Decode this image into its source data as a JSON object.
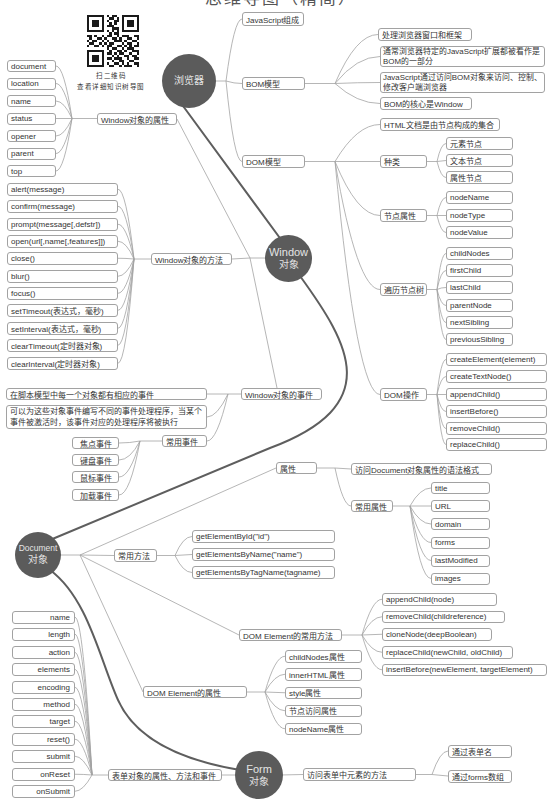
{
  "title": "思维导图（精简）",
  "qr_code": {
    "icon": "qr-code-icon",
    "caption_line1": "扫二维码",
    "caption_line2": "查看详细知识树导图"
  },
  "window_object": {
    "label_line1": "Window",
    "label_line2": "对象"
  },
  "browser": {
    "label": "浏览器",
    "js_composition": "JavaScript组成",
    "bom": {
      "label": "BOM模型",
      "items": [
        "处理浏览器窗口和框架",
        "通常浏览器特定的JavaScript扩展都被看作是BOM的一部分",
        "JavaScript通过访问BOM对象来访问、控制、修改客户端浏览器",
        "BOM的核心是Window"
      ]
    },
    "dom": {
      "label": "DOM模型",
      "intro": "HTML文档是由节点构成的集合",
      "kinds": {
        "label": "种类",
        "items": [
          "元素节点",
          "文本节点",
          "属性节点"
        ]
      },
      "node_props": {
        "label": "节点属性",
        "items": [
          "nodeName",
          "nodeType",
          "nodeValue"
        ]
      },
      "traverse": {
        "label": "遍历节点树",
        "items": [
          "childNodes",
          "firstChild",
          "lastChild",
          "parentNode",
          "nextSibling",
          "previousSibling"
        ]
      },
      "ops": {
        "label": "DOM操作",
        "items": [
          "createElement(element)",
          "createTextNode()",
          "appendChild()",
          "insertBefore()",
          "removeChild()",
          "replaceChild()"
        ]
      }
    }
  },
  "window_props": {
    "label": "Window对象的属性",
    "items": [
      "document",
      "location",
      "name",
      "status",
      "opener",
      "parent",
      "top"
    ]
  },
  "window_methods": {
    "label": "Window对象的方法",
    "items": [
      "alert(message)",
      "confirm(message)",
      "prompt(message[,defstr])",
      "open(url[,name[,features]])",
      "close()",
      "blur()",
      "focus()",
      "setTimeout(表达式，毫秒)",
      "setInterval(表达式，毫秒)",
      "clearTimeout(定时器对象)",
      "clearInterval(定时器对象)"
    ]
  },
  "window_events": {
    "label": "Window对象的事件",
    "items": [
      "在脚本模型中每一个对象都有相应的事件",
      "可以为这些对象事件编写不同的事件处理程序，当某个事件被激活时，该事件对应的处理程序将被执行"
    ],
    "common": {
      "label": "常用事件",
      "items": [
        "焦点事件",
        "键盘事件",
        "鼠标事件",
        "加载事件"
      ]
    }
  },
  "document": {
    "label_line1": "Document",
    "label_line2": "对象",
    "props": {
      "label": "属性",
      "syntax": "访问Document对象属性的语法格式",
      "common": {
        "label": "常用属性",
        "items": [
          "title",
          "URL",
          "domain",
          "forms",
          "lastModified",
          "images"
        ]
      }
    },
    "methods": {
      "label": "常用方法",
      "items": [
        "getElementById(\"id\")",
        "getElementsByName(\"name\")",
        "getElementsByTagName(tagname)"
      ]
    },
    "element_methods": {
      "label": "DOM Element的常用方法",
      "items": [
        "appendChild(node)",
        "removeChild(childreference)",
        "cloneNode(deepBoolean)",
        "replaceChild(newChild, oldChild)",
        "insertBefore(newElement, targetElement)"
      ]
    },
    "element_props": {
      "label": "DOM Element的属性",
      "items": [
        "childNodes属性",
        "innerHTML属性",
        "style属性",
        "节点访问属性",
        "nodeName属性"
      ]
    }
  },
  "form": {
    "label_line1": "Form",
    "label_line2": "对象",
    "members": {
      "label": "表单对象的属性、方法和事件",
      "items": [
        "name",
        "length",
        "action",
        "elements",
        "encoding",
        "method",
        "target",
        "reset()",
        "submit",
        "onReset",
        "onSubmit"
      ]
    },
    "access": {
      "label": "访问表单中元素的方法",
      "items": [
        "通过表单名",
        "通过forms数组"
      ]
    }
  },
  "colors": {
    "background": "#ffffff",
    "circle_fill": "#5b5b5b",
    "circle_text": "#e4e4e4",
    "thick_connector": "#5e5e5e",
    "thin_connector": "#a3a3a3",
    "node_border": "#a2a2a2",
    "node_text": "#333333"
  }
}
